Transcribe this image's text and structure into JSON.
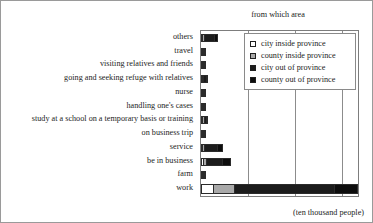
{
  "chart_data": {
    "type": "bar",
    "orientation": "horizontal",
    "stacked": true,
    "title": "from which area",
    "xlabel": "(ten thousand people)",
    "ylabel": "",
    "unit_note": "(ten thousand people)",
    "grid": true,
    "gridlines_x": [
      600,
      1200,
      1800
    ],
    "xlim": [
      0,
      2000
    ],
    "legend_position": "top-right",
    "legend": [
      "city inside province",
      "county inside province",
      "city out of province",
      "county out of province"
    ],
    "categories": [
      "others",
      "travel",
      "visiting relatives and friends",
      "going and seeking refuge with relatives",
      "nurse",
      "handling one's cases",
      "study at a school on a temporary basis or training",
      "on business trip",
      "service",
      "be in business",
      "farm",
      "work"
    ],
    "series": [
      {
        "name": "city inside province",
        "color": "#ffffff",
        "values": [
          14,
          6,
          3,
          9,
          1,
          1,
          16,
          5,
          18,
          24,
          4,
          148
        ]
      },
      {
        "name": "county inside province",
        "color": "#a9a9a9",
        "values": [
          18,
          5,
          2,
          7,
          1,
          1,
          18,
          4,
          22,
          40,
          3,
          270
        ]
      },
      {
        "name": "city out of province",
        "color": "#1c1c1c",
        "values": [
          130,
          40,
          5,
          48,
          2,
          2,
          38,
          22,
          165,
          210,
          42,
          1280
        ]
      },
      {
        "name": "county out of province",
        "color": "#0d0d0d",
        "values": [
          60,
          18,
          3,
          22,
          1,
          1,
          18,
          10,
          80,
          106,
          20,
          300
        ]
      }
    ]
  },
  "colors": {
    "series_0": "#ffffff",
    "series_1": "#a9a9a9",
    "series_2": "#1c1c1c",
    "series_3": "#0d0d0d",
    "frame": "#7d7d7d",
    "grid": "#8c8c8c",
    "text": "#242424",
    "background": "#ffffff"
  }
}
